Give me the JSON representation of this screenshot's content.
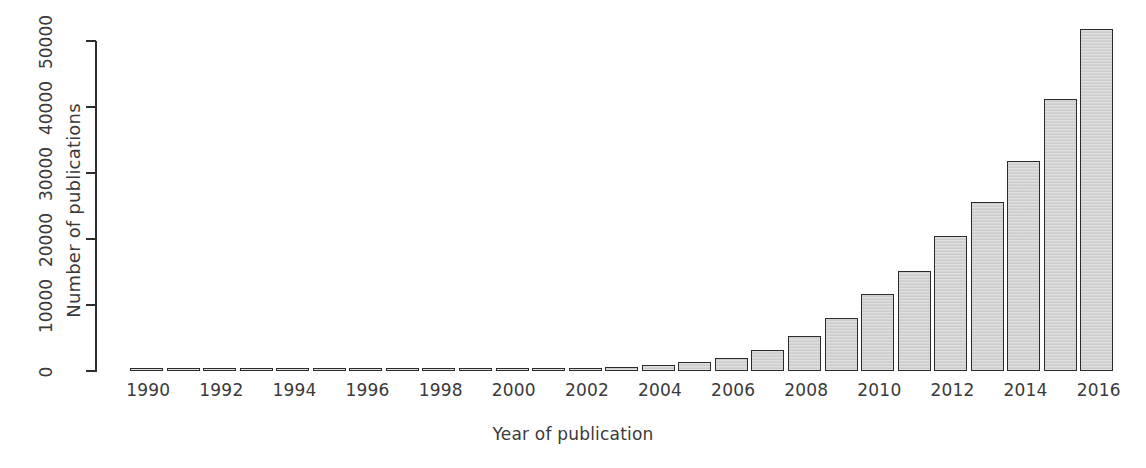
{
  "chart_data": {
    "type": "bar",
    "title": "",
    "xlabel": "Year of publication",
    "ylabel": "Number of publications",
    "categories": [
      1990,
      1991,
      1992,
      1993,
      1994,
      1995,
      1996,
      1997,
      1998,
      1999,
      2000,
      2001,
      2002,
      2003,
      2004,
      2005,
      2006,
      2007,
      2008,
      2009,
      2010,
      2011,
      2012,
      2013,
      2014,
      2015,
      2016
    ],
    "values": [
      60,
      70,
      80,
      90,
      110,
      130,
      150,
      170,
      200,
      230,
      280,
      330,
      450,
      600,
      900,
      1350,
      1900,
      3200,
      5300,
      8000,
      11700,
      15200,
      20500,
      25600,
      31800,
      41200,
      51800
    ],
    "xtick_labels": [
      "1990",
      "1992",
      "1994",
      "1996",
      "1998",
      "2000",
      "2002",
      "2004",
      "2006",
      "2008",
      "2010",
      "2012",
      "2014",
      "2016"
    ],
    "ytick_labels": [
      "0",
      "10000",
      "20000",
      "30000",
      "40000",
      "50000"
    ],
    "ytick_values": [
      0,
      10000,
      20000,
      30000,
      40000,
      50000
    ],
    "ylim": [
      0,
      50200
    ],
    "grid": false,
    "legend": false,
    "bar_fill_color": "#d4d4d4",
    "bar_edge_color": "#2b2b2b",
    "axis_color": "#2e2e2e",
    "text_color": "#3a3a3a",
    "background_color": "#ffffff"
  }
}
